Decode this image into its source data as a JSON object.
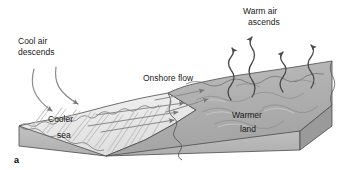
{
  "figure": {
    "panel_letter": "a",
    "topic": "sea-breeze-circulation-diagram",
    "labels": {
      "cool_air_line1": "Cool air",
      "cool_air_line2": "descends",
      "warm_air_line1": "Warm air",
      "warm_air_line2": "ascends",
      "onshore_flow": "Onshore flow",
      "cooler_line1": "Cooler",
      "cooler_line2": "sea",
      "warmer_line1": "Warmer",
      "warmer_line2": "land"
    }
  },
  "colors": {
    "background": "#ffffff",
    "outline": "#4a4a4a",
    "sea_top": "#ededed",
    "sea_front": "#b8b8b8",
    "land_top": "#b0b0b0",
    "land_front": "#b8b8b8",
    "land_side": "#9a9a9a",
    "arrow": "#777777",
    "wavy_arrow": "#4a4a4a",
    "text": "#1a1a1a"
  },
  "elements": {
    "ascending_arrow_count": 4,
    "descending_arrow_count": 2,
    "onshore_arrow_count": 5,
    "wave_ridge_count": 9
  }
}
